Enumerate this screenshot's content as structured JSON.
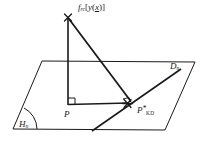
{
  "figure": {
    "type": "geometric-diagram",
    "background_color": "#ffffff",
    "stroke_color": "#1a1a1a",
    "labels": {
      "apex_function": "f",
      "apex_function_sub": "rc",
      "apex_bracket_open": "[",
      "apex_argument": "y",
      "apex_arg_open": "(",
      "apex_arg_variable": "x",
      "apex_arg_close": ")",
      "apex_bracket_close": "]",
      "point_p": "P",
      "point_pkd": "P",
      "point_pkd_star": "*",
      "point_pkd_sub": "KD",
      "line_dn": "D",
      "line_dn_sub": "n",
      "plane_hn": "H",
      "plane_hn_sub": "n"
    },
    "markers": {
      "apex_marker": "x-cross",
      "intersection_marker": "asterisk-star",
      "right_angle_at_p": "square",
      "right_angle_at_pkd": "square",
      "angle_arc_at_hn": "arc"
    },
    "geometry": {
      "plane_corners": [
        [
          42,
          61
        ],
        [
          195,
          62
        ],
        [
          165,
          130
        ],
        [
          13,
          129
        ]
      ],
      "apex": [
        68,
        17
      ],
      "point_p": [
        68,
        105
      ],
      "point_pkd": [
        128,
        103
      ],
      "vertical_segment": [
        [
          68,
          17
        ],
        [
          68,
          105
        ]
      ],
      "base_segment": [
        [
          68,
          105
        ],
        [
          128,
          103
        ]
      ],
      "hypotenuse_segment": [
        [
          68,
          17
        ],
        [
          131,
          101
        ]
      ],
      "line_dn": [
        [
          92,
          131
        ],
        [
          181,
          69
        ]
      ]
    }
  }
}
